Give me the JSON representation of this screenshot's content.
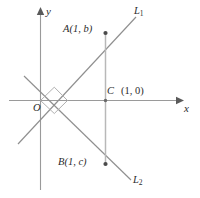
{
  "figure": {
    "background_color": "#ffffff",
    "axis_color": "#9a9a9a",
    "line_color": "#8f8f8f",
    "segment_color": "#b4b4b4",
    "text_color": "#2b2b2b",
    "width": 200,
    "height": 198
  },
  "axes": {
    "x_label": "x",
    "y_label": "y",
    "origin_label": "O"
  },
  "lines": [
    {
      "id": "L1",
      "label_base": "L",
      "label_sub": "1",
      "description": "line through origin with positive slope passing through A"
    },
    {
      "id": "L2",
      "label_base": "L",
      "label_sub": "2",
      "description": "line through origin with negative slope passing through B"
    }
  ],
  "points": [
    {
      "id": "A",
      "name": "A",
      "label": "A(1, b)",
      "coords_text": "(1, b)",
      "x": 1,
      "y": "b"
    },
    {
      "id": "C",
      "name": "C",
      "label": "C",
      "coords_text": "(1, 0)",
      "x": 1,
      "y": 0
    },
    {
      "id": "B",
      "name": "B",
      "label": "B(1, c)",
      "coords_text": "(1, c)",
      "x": 1,
      "y": "c"
    }
  ],
  "markers": {
    "right_angle": "right-angle marker at origin between L1 and L2"
  }
}
